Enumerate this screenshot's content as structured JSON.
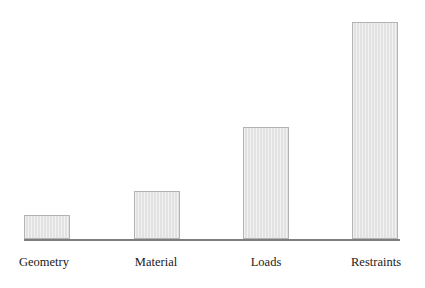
{
  "chart_data": {
    "type": "bar",
    "title": "",
    "subtitle": "",
    "xlabel": "",
    "ylabel": "",
    "categories": [
      "Geometry",
      "Material",
      "Loads",
      "Restraints"
    ],
    "values": [
      24,
      48,
      112,
      217
    ],
    "ylim": [
      0,
      240
    ],
    "grid": false,
    "legend": null,
    "axis": {
      "x_axis_visible": true,
      "y_axis_visible": false,
      "tick_labels_x": [
        "Geometry",
        "Material",
        "Loads",
        "Restraints"
      ],
      "tick_labels_y": []
    },
    "annotations": [],
    "series": [
      {
        "name": "",
        "values": [
          24,
          48,
          112,
          217
        ]
      }
    ]
  },
  "style": {
    "background": "#ffffff",
    "bar_fill": "#e2e2e2",
    "bar_border": "#b3b3b3",
    "axis_color": "#7d7d7d",
    "label_color": "#1a1a1a"
  },
  "geometry": {
    "baseline_y": 239,
    "axis_left": 24,
    "axis_right": 400,
    "bar_width": 46,
    "label_y": 255,
    "bars": [
      {
        "left": 24,
        "top": 215,
        "height": 24
      },
      {
        "left": 134,
        "top": 191,
        "height": 48
      },
      {
        "left": 243,
        "top": 127,
        "height": 112
      },
      {
        "left": 352,
        "top": 22,
        "height": 217
      }
    ],
    "labels": [
      {
        "center": 44,
        "width": 110
      },
      {
        "center": 156,
        "width": 110
      },
      {
        "center": 266,
        "width": 110
      },
      {
        "center": 376,
        "width": 110
      }
    ]
  }
}
